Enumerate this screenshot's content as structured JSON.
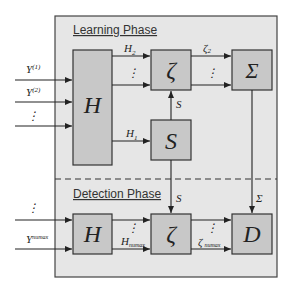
{
  "diagram": {
    "learning_phase": {
      "title": "Learning Phase",
      "inputs": [
        {
          "label": "Y",
          "sup": "(1)"
        },
        {
          "label": "Y",
          "sup": "(2)"
        },
        {
          "label": "⋮",
          "sup": ""
        }
      ],
      "blocks": {
        "H": "H",
        "zeta": "ζ",
        "sigma": "Σ",
        "S": "S"
      },
      "edges": {
        "H2": {
          "label": "H",
          "sub": "2"
        },
        "H1": {
          "label": "H",
          "sub": "1"
        },
        "zeta2": {
          "label": "ζ",
          "sub": "2"
        },
        "s": "S",
        "dots": "⋮"
      }
    },
    "detection_phase": {
      "title": "Detection Phase",
      "inputs": [
        {
          "label": "⋮",
          "sup": ""
        },
        {
          "label": "Y",
          "sup": "numax"
        }
      ],
      "blocks": {
        "H": "H",
        "zeta": "ζ",
        "D": "D"
      },
      "edges": {
        "Hnumax": {
          "label": "H",
          "sub": "numax"
        },
        "zetanumax": {
          "label": "ζ",
          "sub": "numax"
        },
        "s": "S",
        "sigma": "Σ",
        "dots": "⋮"
      }
    },
    "colors": {
      "panel_bg": "#e6e6e6",
      "block_fill": "#c8c8c8",
      "stroke": "#333333"
    }
  }
}
